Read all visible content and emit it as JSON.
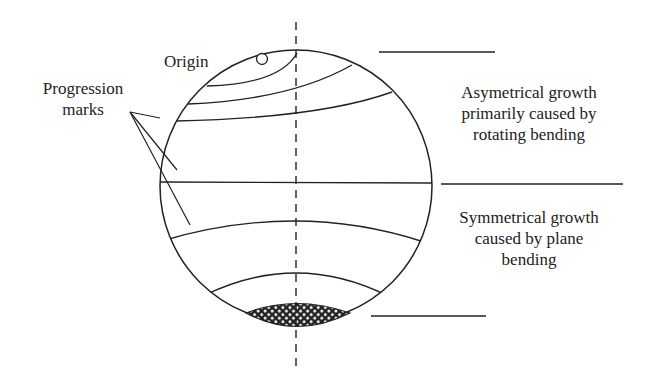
{
  "diagram": {
    "labels": {
      "origin": "Origin",
      "progression_marks": [
        "Progression",
        "marks"
      ],
      "asymmetrical": [
        "Asymetrical growth",
        "primarily caused by",
        "rotating bending"
      ],
      "symmetrical": [
        "Symmetrical growth",
        "caused by plane",
        "bending"
      ]
    },
    "colors": {
      "stroke": "#222222",
      "background": "#ffffff",
      "hatch": "#222222"
    }
  }
}
